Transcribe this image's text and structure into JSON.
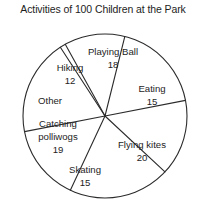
{
  "chart_data": {
    "type": "pie",
    "title": "Activities of 100 Children at the Park",
    "total": 100,
    "grid": false,
    "legend": "none",
    "labels_position": "inside-slices",
    "categories": [
      "Playing Ball",
      "Eating",
      "Flying kites",
      "Skating",
      "Catching polliwogs",
      "Other",
      "Hiking"
    ],
    "values": [
      18,
      15,
      20,
      15,
      19,
      1,
      12
    ],
    "slices": [
      {
        "label": "Playing Ball",
        "value": "18",
        "value_shown": true,
        "label_x": 113,
        "label_y": 52,
        "value_x": 113,
        "value_y": 65,
        "start_deg": -76,
        "end_deg": -11
      },
      {
        "label": "Eating",
        "value": "15",
        "value_shown": true,
        "label_x": 152,
        "label_y": 89,
        "value_x": 152,
        "value_y": 102,
        "start_deg": -11,
        "end_deg": 43
      },
      {
        "label": "Flying kites",
        "value": "20",
        "value_shown": true,
        "label_x": 142,
        "label_y": 145,
        "value_x": 142,
        "value_y": 158,
        "start_deg": 43,
        "end_deg": 115
      },
      {
        "label": "Skating",
        "value": "15",
        "value_shown": true,
        "label_x": 85,
        "label_y": 170,
        "value_x": 85,
        "value_y": 183,
        "start_deg": 115,
        "end_deg": 169
      },
      {
        "label": "Catching polliwogs",
        "value": "19",
        "value_shown": true,
        "label_line1": "Catching",
        "label_line2": "polliwogs",
        "label_x": 58,
        "label_y": 124,
        "label2_y": 137,
        "value_x": 58,
        "value_y": 150,
        "start_deg": 169,
        "end_deg": 237
      },
      {
        "label": "Other",
        "value": "",
        "value_shown": false,
        "label_x": 50,
        "label_y": 101,
        "start_deg": 237,
        "end_deg": 241
      },
      {
        "label": "Hiking",
        "value": "12",
        "value_shown": true,
        "label_x": 70,
        "label_y": 68,
        "value_x": 70,
        "value_y": 81,
        "start_deg": 241,
        "end_deg": 284
      }
    ],
    "geometry": {
      "cx": 105,
      "cy": 116,
      "r": 82
    },
    "colors": {
      "stroke": "#2b2b2b",
      "fill": "#ffffff",
      "text": "#1d1d1d",
      "background": "#ffffff"
    }
  }
}
